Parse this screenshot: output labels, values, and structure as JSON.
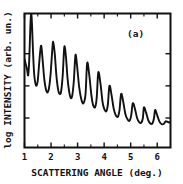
{
  "figure": {
    "panel_label": "(a)",
    "ink_color": "#111111",
    "background_color": "#ffffff"
  },
  "chart_data": {
    "type": "line",
    "title": "",
    "subtitle": "",
    "panel_label": "(a)",
    "xlabel": "SCATTERING ANGLE (deg.)",
    "ylabel": "log INTENSITY (arb. un.)",
    "xlim": [
      1.0,
      6.5
    ],
    "ylim": [
      0.0,
      10.0
    ],
    "x_tick_labels": [
      "1",
      "2",
      "3",
      "4",
      "5",
      "6"
    ],
    "x_ticks": [
      1,
      2,
      3,
      4,
      5,
      6
    ],
    "x_minor_ticks": [
      1.5,
      2.5,
      3.5,
      4.5,
      5.5
    ],
    "y_ticks": [
      2.2,
      4.6,
      7.0
    ],
    "y_tick_labels": [
      "",
      "",
      ""
    ],
    "grid": false,
    "legend": false,
    "ticks_all_sides": true,
    "peaks_deg": [
      1.25,
      1.62,
      2.08,
      2.5,
      2.92,
      3.36,
      3.78,
      4.2,
      4.64,
      5.08,
      5.5,
      5.92
    ],
    "peak_values": [
      10.0,
      7.6,
      7.9,
      7.5,
      6.9,
      6.3,
      5.6,
      4.6,
      4.0,
      3.3,
      3.0,
      2.8
    ],
    "series": [
      {
        "name": "reflectivity",
        "x": [
          1.0,
          1.05,
          1.1,
          1.14,
          1.18,
          1.22,
          1.25,
          1.28,
          1.32,
          1.36,
          1.4,
          1.45,
          1.5,
          1.55,
          1.62,
          1.68,
          1.74,
          1.8,
          1.86,
          1.92,
          1.98,
          2.04,
          2.08,
          2.14,
          2.2,
          2.26,
          2.32,
          2.38,
          2.44,
          2.5,
          2.56,
          2.62,
          2.68,
          2.74,
          2.8,
          2.86,
          2.92,
          2.98,
          3.06,
          3.14,
          3.22,
          3.3,
          3.36,
          3.44,
          3.52,
          3.58,
          3.66,
          3.72,
          3.78,
          3.86,
          3.94,
          4.0,
          4.08,
          4.14,
          4.2,
          4.28,
          4.36,
          4.44,
          4.52,
          4.58,
          4.64,
          4.72,
          4.8,
          4.88,
          4.96,
          5.02,
          5.08,
          5.16,
          5.24,
          5.32,
          5.4,
          5.46,
          5.5,
          5.58,
          5.66,
          5.74,
          5.82,
          5.88,
          5.92,
          6.0,
          6.08,
          6.16,
          6.24,
          6.32,
          6.4,
          6.5
        ],
        "y": [
          6.6,
          6.2,
          5.8,
          5.4,
          6.6,
          9.0,
          10.0,
          9.3,
          7.2,
          5.6,
          4.9,
          4.6,
          5.0,
          6.2,
          7.6,
          6.6,
          5.2,
          4.4,
          4.1,
          4.4,
          5.4,
          7.1,
          7.9,
          7.0,
          5.4,
          4.4,
          4.0,
          4.2,
          5.4,
          7.5,
          6.8,
          5.2,
          4.2,
          3.7,
          3.9,
          5.0,
          6.9,
          6.1,
          4.5,
          3.6,
          3.3,
          4.0,
          6.3,
          5.4,
          3.9,
          3.2,
          3.0,
          3.7,
          5.6,
          4.8,
          3.4,
          2.9,
          2.7,
          3.2,
          4.6,
          3.9,
          2.9,
          2.4,
          2.3,
          2.8,
          4.0,
          3.4,
          2.5,
          2.1,
          2.0,
          2.4,
          3.3,
          2.9,
          2.2,
          1.9,
          1.85,
          2.2,
          3.0,
          2.6,
          2.05,
          1.8,
          1.8,
          2.2,
          2.8,
          2.4,
          1.95,
          1.75,
          1.75,
          1.95,
          1.9,
          1.85
        ]
      }
    ]
  }
}
